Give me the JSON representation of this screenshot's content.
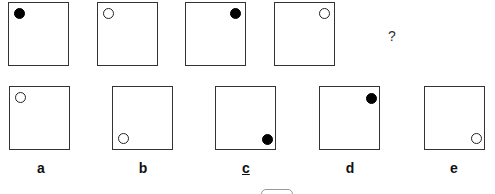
{
  "puzzle": {
    "sequence": [
      {
        "dot": "filled",
        "position": "top-left"
      },
      {
        "dot": "hollow",
        "position": "top-left"
      },
      {
        "dot": "filled",
        "position": "top-right"
      },
      {
        "dot": "hollow",
        "position": "top-right"
      }
    ],
    "question_mark": "?",
    "options": [
      {
        "label": "a",
        "dot": "hollow",
        "position": "top-left",
        "underlined": false
      },
      {
        "label": "b",
        "dot": "hollow",
        "position": "bottom-left",
        "underlined": false
      },
      {
        "label": "c",
        "dot": "filled",
        "position": "bottom-right",
        "underlined": true
      },
      {
        "label": "d",
        "dot": "filled",
        "position": "top-right",
        "underlined": false
      },
      {
        "label": "e",
        "dot": "hollow",
        "position": "bottom-right",
        "underlined": false
      }
    ]
  }
}
